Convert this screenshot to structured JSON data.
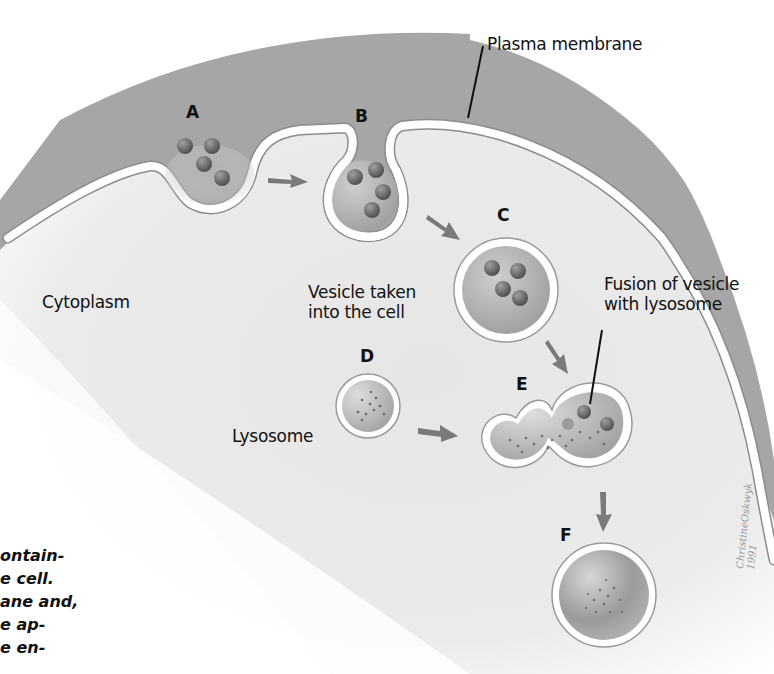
{
  "figure": {
    "colors": {
      "background": "#ffffff",
      "cytoplasm": "#e9e9e9",
      "extracellular": "#a3a3a3",
      "membrane": "#ffffff",
      "membrane_edge": "#8a8a8a",
      "vesicle_fill": "#b8b8b8",
      "particle": "#6e6e6e",
      "arrow": "#7a7a7a",
      "text": "#111111"
    },
    "steps": [
      {
        "id": "A",
        "label": "A",
        "desc": "Particles approach invaginating plasma membrane"
      },
      {
        "id": "B",
        "label": "B",
        "desc": "Membrane pinches around particles"
      },
      {
        "id": "C",
        "label": "C",
        "desc": "Vesicle taken into the cell"
      },
      {
        "id": "D",
        "label": "D",
        "desc": "Lysosome"
      },
      {
        "id": "E",
        "label": "E",
        "desc": "Fusion of vesicle with lysosome"
      },
      {
        "id": "F",
        "label": "F",
        "desc": "Digested contents"
      }
    ],
    "labels": {
      "plasma_membrane": "Plasma membrane",
      "cytoplasm": "Cytoplasm",
      "vesicle_line1": "Vesicle taken",
      "vesicle_line2": "into the cell",
      "lysosome": "Lysosome",
      "fusion_line1": "Fusion of vesicle",
      "fusion_line2": "with lysosome"
    },
    "caption_fragment": [
      "ontain-",
      "e cell.",
      "ane and,",
      "e ap-",
      "e en-"
    ],
    "signature": "ChristineOskwyk 1991"
  }
}
